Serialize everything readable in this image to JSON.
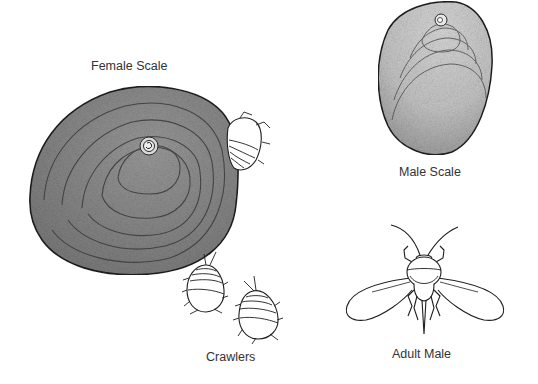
{
  "figure": {
    "labels": {
      "female_scale": "Female Scale",
      "male_scale": "Male Scale",
      "crawlers": "Crawlers",
      "adult_male": "Adult Male"
    },
    "colors": {
      "background": "#ffffff",
      "ink": "#222222",
      "label_text": "#333333",
      "female_shading": "#8a8a8a",
      "male_shading": "#c8c8c8"
    }
  }
}
